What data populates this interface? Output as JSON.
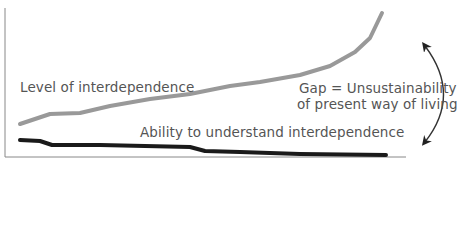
{
  "chart_data": {
    "type": "line",
    "title": "",
    "xlabel": "",
    "ylabel": "",
    "grid": false,
    "series": [
      {
        "name": "Level of interdependence",
        "color": "#999999",
        "points": [
          [
            20,
            124
          ],
          [
            50,
            114
          ],
          [
            80,
            113
          ],
          [
            110,
            106
          ],
          [
            150,
            99
          ],
          [
            190,
            94
          ],
          [
            230,
            86
          ],
          [
            260,
            82
          ],
          [
            300,
            75
          ],
          [
            330,
            66
          ],
          [
            355,
            52
          ],
          [
            370,
            38
          ],
          [
            382,
            13
          ]
        ]
      },
      {
        "name": "Ability to understand interdependence",
        "color": "#1a1a1a",
        "points": [
          [
            20,
            140
          ],
          [
            40,
            141
          ],
          [
            52,
            145
          ],
          [
            100,
            145
          ],
          [
            190,
            147
          ],
          [
            205,
            151
          ],
          [
            240,
            152
          ],
          [
            300,
            154
          ],
          [
            386,
            155
          ]
        ]
      }
    ],
    "annotations": [
      {
        "text": "Gap = Unsustainability of present way of living",
        "type": "double-arrow"
      }
    ]
  },
  "labels": {
    "series1": "Level of interdependence",
    "series2": "Ability to understand interdependence",
    "gap_line1": "Gap = Unsustainability",
    "gap_line2": "of present way of living"
  }
}
